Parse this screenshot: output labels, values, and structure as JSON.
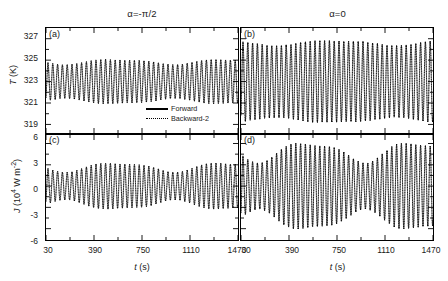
{
  "figure": {
    "columns": [
      {
        "title": "α=-π/2"
      },
      {
        "title": "α0"
      }
    ],
    "column_titles": {
      "left": "α=-π/2",
      "right": "α=0"
    },
    "panel_labels": {
      "a": "(a)",
      "b": "(b)",
      "c": "(c)",
      "d": "(d)"
    },
    "axis_titles": {
      "y_top": "T (K)",
      "y_bottom": "J (10⁴ W m⁻²)",
      "x": "t (s)"
    },
    "ticks": {
      "x_labels": [
        "30",
        "390",
        "750",
        "1110",
        "1470"
      ],
      "y_top_labels": [
        "319",
        "321",
        "323",
        "325",
        "327"
      ],
      "y_bottom_labels": [
        "-6",
        "-3",
        "0",
        "3",
        "6"
      ]
    },
    "legend": {
      "items": [
        {
          "label": "Forward",
          "style": "solid"
        },
        {
          "label": "Backward-2",
          "style": "dotted"
        }
      ]
    },
    "colors": {
      "line": "#000000",
      "frame": "#000000",
      "background": "#ffffff"
    }
  },
  "chart_data": [
    {
      "type": "line",
      "panel": "(a)",
      "title": "α=-π/2",
      "xlabel": "t (s)",
      "ylabel": "T (K)",
      "xlim": [
        30,
        1470
      ],
      "ylim": [
        318.2,
        328.0
      ],
      "xticks": [
        30,
        390,
        750,
        1110,
        1470
      ],
      "yticks": [
        319,
        321,
        323,
        325,
        327
      ],
      "grid": false,
      "waveform": {
        "description": "fast sinusoidal oscillation with slowly varying amplitude envelope",
        "carrier_period_s": 36,
        "mean": 323.0,
        "amplitude_mean": 1.85,
        "envelope_modulation": 0.12,
        "envelope_period_s": 820,
        "envelope_phase_deg": 200
      },
      "series": [
        {
          "name": "Forward",
          "style": "solid"
        },
        {
          "name": "Backward-2",
          "style": "dotted"
        }
      ]
    },
    {
      "type": "line",
      "panel": "(b)",
      "title": "α=0",
      "xlabel": "t (s)",
      "ylabel": "T (K)",
      "xlim": [
        30,
        1470
      ],
      "ylim": [
        318.2,
        328.0
      ],
      "xticks": [
        30,
        390,
        750,
        1110,
        1470
      ],
      "yticks": [
        319,
        321,
        323,
        325,
        327
      ],
      "grid": false,
      "waveform": {
        "description": "fast sinusoidal oscillation, larger amplitude than (a), weak envelope",
        "carrier_period_s": 36,
        "mean": 323.0,
        "amplitude_mean": 3.6,
        "envelope_modulation": 0.06,
        "envelope_period_s": 900,
        "envelope_phase_deg": 160
      },
      "series": [
        {
          "name": "Forward",
          "style": "solid"
        },
        {
          "name": "Backward-2",
          "style": "dotted"
        }
      ]
    },
    {
      "type": "line",
      "panel": "(c)",
      "title": "α=-π/2",
      "xlabel": "t (s)",
      "ylabel": "J (10⁴ W m⁻²)",
      "xlim": [
        30,
        1470
      ],
      "ylim": [
        -7.6,
        7.2
      ],
      "xticks": [
        30,
        390,
        750,
        1110,
        1470
      ],
      "yticks": [
        -6,
        -3,
        0,
        3,
        6
      ],
      "grid": false,
      "waveform": {
        "description": "fast oscillation about zero with beat-like amplitude envelope peaking near t=750 s",
        "carrier_period_s": 36,
        "mean": 0.0,
        "amplitude_mean": 2.7,
        "envelope_modulation": 0.22,
        "envelope_period_s": 820,
        "envelope_phase_deg": 200
      },
      "series": [
        {
          "name": "Forward",
          "style": "solid"
        },
        {
          "name": "Backward-2",
          "style": "dotted"
        }
      ]
    },
    {
      "type": "line",
      "panel": "(d)",
      "title": "α=0",
      "xlabel": "t (s)",
      "ylabel": "J (10⁴ W m⁻²)",
      "xlim": [
        30,
        1470
      ],
      "ylim": [
        -7.6,
        7.2
      ],
      "xticks": [
        30,
        390,
        750,
        1110,
        1470
      ],
      "yticks": [
        -6,
        -3,
        0,
        3,
        6
      ],
      "grid": false,
      "waveform": {
        "description": "fast oscillation about zero, large amplitude with pronounced envelope maximum near t=750 s",
        "carrier_period_s": 36,
        "mean": 0.0,
        "amplitude_mean": 4.9,
        "envelope_modulation": 0.26,
        "envelope_period_s": 800,
        "envelope_phase_deg": 205
      },
      "series": [
        {
          "name": "Forward",
          "style": "solid"
        },
        {
          "name": "Backward-2",
          "style": "dotted"
        }
      ]
    }
  ]
}
